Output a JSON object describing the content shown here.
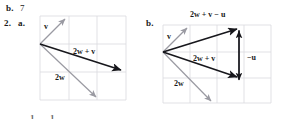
{
  "page": {
    "width": 302,
    "height": 119,
    "background": "#ffffff",
    "ink_color": "#1a1a1a",
    "grid_color": "#d9d9de",
    "dark_vector_color": "#17171c",
    "light_vector_color": "#9a9aa2"
  },
  "answers": {
    "prev_part_letter": "b.",
    "prev_part_value": "7",
    "problem_number": "2.",
    "part_a_letter": "a.",
    "part_b_letter": "b."
  },
  "figure_a": {
    "name": "vector-diagram-a",
    "grid": {
      "x": 40,
      "y": 16,
      "width": 86,
      "height": 84,
      "cols": 3,
      "rows": 3,
      "cell": 28
    },
    "origin": {
      "x": 40,
      "y": 44
    },
    "labels": [
      {
        "id": "v",
        "text": "v",
        "x": 45,
        "y": 26
      },
      {
        "id": "2w_plus_v",
        "text": "2w + v",
        "x": 74,
        "y": 52
      },
      {
        "id": "2w",
        "text": "2w",
        "x": 56,
        "y": 78
      }
    ],
    "vectors": [
      {
        "id": "v",
        "from": [
          40,
          44
        ],
        "to": [
          66,
          18
        ],
        "color": "#9a9aa2",
        "label": "v"
      },
      {
        "id": "2w",
        "from": [
          40,
          44
        ],
        "to": [
          97,
          98
        ],
        "color": "#9a9aa2",
        "label": "2w"
      },
      {
        "id": "2w_plus_v",
        "from": [
          40,
          44
        ],
        "to": [
          123,
          71
        ],
        "color": "#17171c",
        "label": "2w + v"
      }
    ]
  },
  "figure_b": {
    "name": "vector-diagram-b",
    "grid": {
      "x": 163,
      "y": 25,
      "width": 108,
      "height": 78,
      "cols": 4,
      "rows": 3,
      "cell": 27
    },
    "origin": {
      "x": 163,
      "y": 52
    },
    "labels": [
      {
        "id": "2w_plus_v_minus_u",
        "text": "2w + v − u",
        "x": 191,
        "y": 15
      },
      {
        "id": "v",
        "text": "v",
        "x": 168,
        "y": 36
      },
      {
        "id": "2w_plus_v",
        "text": "2w + v",
        "x": 194,
        "y": 59
      },
      {
        "id": "minus_u",
        "text": "−u",
        "x": 247,
        "y": 56
      },
      {
        "id": "2w",
        "text": "2w",
        "x": 175,
        "y": 84
      }
    ],
    "vectors": [
      {
        "id": "v",
        "from": [
          163,
          52
        ],
        "to": [
          188,
          27
        ],
        "color": "#9a9aa2",
        "label": "v"
      },
      {
        "id": "2w",
        "from": [
          163,
          52
        ],
        "to": [
          212,
          103
        ],
        "color": "#9a9aa2",
        "label": "2w"
      },
      {
        "id": "2w_plus_v",
        "from": [
          163,
          52
        ],
        "to": [
          239,
          78
        ],
        "color": "#17171c",
        "label": "2w + v"
      },
      {
        "id": "2w_plus_v_minus_u",
        "from": [
          163,
          52
        ],
        "to": [
          239,
          28
        ],
        "color": "#17171c",
        "label": "2w + v − u"
      },
      {
        "id": "minus_u",
        "from": [
          239,
          78
        ],
        "to": [
          239,
          28
        ],
        "color": "#17171c",
        "label": "−u"
      }
    ]
  },
  "footer": {
    "fragment_left": "1",
    "fragment_right": "1"
  }
}
